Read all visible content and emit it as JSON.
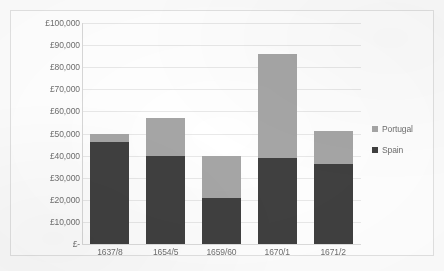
{
  "chart_data": {
    "type": "bar",
    "stacked": true,
    "title": "",
    "xlabel": "",
    "ylabel": "",
    "categories": [
      "1637/8",
      "1654/5",
      "1659/60",
      "1670/1",
      "1671/2"
    ],
    "series": [
      {
        "name": "Spain",
        "color": "#404040",
        "values": [
          46000,
          40000,
          21000,
          39000,
          36000
        ]
      },
      {
        "name": "Portugal",
        "color": "#a6a6a6",
        "values": [
          4000,
          17000,
          19000,
          47000,
          15000
        ]
      }
    ],
    "totals": [
      50000,
      57000,
      40000,
      86000,
      51000
    ],
    "ylim": [
      0,
      100000
    ],
    "ytick_values": [
      0,
      10000,
      20000,
      30000,
      40000,
      50000,
      60000,
      70000,
      80000,
      90000,
      100000
    ],
    "ytick_labels": [
      "£-",
      "£10,000",
      "£20,000",
      "£30,000",
      "£40,000",
      "£50,000",
      "£60,000",
      "£70,000",
      "£80,000",
      "£90,000",
      "£100,000"
    ],
    "grid": true,
    "legend_position": "right",
    "legend": [
      "Portugal",
      "Spain"
    ]
  }
}
